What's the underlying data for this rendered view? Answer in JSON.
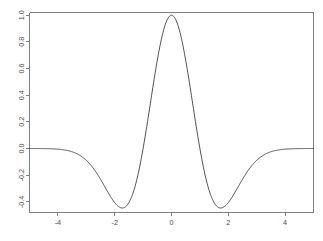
{
  "chart_data": {
    "type": "line",
    "title": "",
    "subtitle": "",
    "xlabel": "",
    "ylabel": "",
    "xlim": [
      -5,
      5
    ],
    "ylim": [
      -0.48,
      1.02
    ],
    "grid": false,
    "legend": null,
    "x_ticks": [
      -4,
      -2,
      0,
      2,
      4
    ],
    "x_tick_labels": [
      "-4",
      "-2",
      "0",
      "2",
      "4"
    ],
    "y_ticks": [
      -0.4,
      -0.2,
      0.0,
      0.2,
      0.4,
      0.6,
      0.8,
      1.0
    ],
    "y_tick_labels": [
      "-0.4",
      "-0.2",
      "0.0",
      "0.2",
      "0.4",
      "0.6",
      "0.8",
      "1.0"
    ],
    "series": [
      {
        "name": "Mexican hat wavelet",
        "color": "#3a3a3a",
        "x": [
          -5.0,
          -4.9,
          -4.8,
          -4.7,
          -4.6,
          -4.5,
          -4.4,
          -4.3,
          -4.2,
          -4.1,
          -4.0,
          -3.9,
          -3.8,
          -3.7,
          -3.6,
          -3.5,
          -3.4,
          -3.3,
          -3.2,
          -3.1,
          -3.0,
          -2.9,
          -2.8,
          -2.7,
          -2.6,
          -2.5,
          -2.4,
          -2.3,
          -2.2,
          -2.1,
          -2.0,
          -1.9,
          -1.8,
          -1.7,
          -1.6,
          -1.5,
          -1.4,
          -1.3,
          -1.2,
          -1.1,
          -1.0,
          -0.9,
          -0.8,
          -0.7,
          -0.6,
          -0.5,
          -0.4,
          -0.3,
          -0.2,
          -0.1,
          0.0,
          0.1,
          0.2,
          0.3,
          0.4,
          0.5,
          0.6,
          0.7,
          0.8,
          0.9,
          1.0,
          1.1,
          1.2,
          1.3,
          1.4,
          1.5,
          1.6,
          1.7,
          1.8,
          1.9,
          2.0,
          2.1,
          2.2,
          2.3,
          2.4,
          2.5,
          2.6,
          2.7,
          2.8,
          2.9,
          3.0,
          3.1,
          3.2,
          3.3,
          3.4,
          3.5,
          3.6,
          3.7,
          3.8,
          3.9,
          4.0,
          4.1,
          4.2,
          4.3,
          4.4,
          4.5,
          4.6,
          4.7,
          4.8,
          4.9,
          5.0
        ],
        "y": [
          -0.002,
          -0.0024,
          -0.0028,
          -0.0033,
          -0.0038,
          -0.0045,
          -0.0052,
          -0.0061,
          -0.007,
          -0.0081,
          -0.0094,
          -0.0108,
          -0.0124,
          -0.0142,
          -0.0162,
          -0.0185,
          -0.021,
          -0.0238,
          -0.0269,
          -0.0303,
          -0.034,
          -0.0381,
          -0.0425,
          -0.0473,
          -0.0525,
          -0.058,
          -0.0639,
          -0.0701,
          -0.0767,
          -0.0835,
          -0.0906,
          -0.0977,
          -0.105,
          -0.1122,
          -0.1194,
          -0.1263,
          -0.1328,
          -0.1388,
          -0.144,
          -0.1483,
          -0.1516,
          -0.1536,
          -0.1541,
          -0.1531,
          -0.1503,
          -0.1456,
          -0.139,
          -0.1304,
          -0.1198,
          -0.1073,
          -0.093,
          -0.0769,
          -0.0593,
          -0.0403,
          -0.02,
          0.0013,
          0.0235,
          0.0463,
          0.0694,
          0.0925,
          0.1154,
          0.1378,
          0.1594,
          0.18,
          0.1993,
          0.2172,
          0.2335,
          0.2479,
          0.2604,
          0.2709,
          0.2793,
          0.2855,
          0.2895,
          0.2914,
          0.2911,
          0.2888,
          0.2846,
          0.2785,
          0.2708,
          0.2615,
          0.2509,
          0.2392,
          0.2265,
          0.2131,
          0.1991,
          0.1848,
          0.1703,
          0.1558,
          0.1414,
          0.1274,
          0.1138,
          0.1007,
          0.0882,
          0.0765,
          0.0655,
          0.0553,
          0.0459,
          0.0374,
          0.0297,
          0.0229,
          0.0169
        ],
        "formula": "psi(x) = (1 - x^2) * exp(-x^2 / 2)",
        "peak": {
          "x": 0.0,
          "y": 1.0
        },
        "minima": [
          {
            "x": -1.732,
            "y": -0.446
          },
          {
            "x": 1.732,
            "y": -0.446
          }
        ],
        "zero_crossings": [
          -1.0,
          1.0
        ]
      }
    ]
  },
  "figure": {
    "background_color": "#ffffff",
    "axis_color": "#808080",
    "tick_label_color": "#4d4d4d",
    "curve_color": "#3a3a3a",
    "y_tick_label_orientation": "rotated-90"
  }
}
